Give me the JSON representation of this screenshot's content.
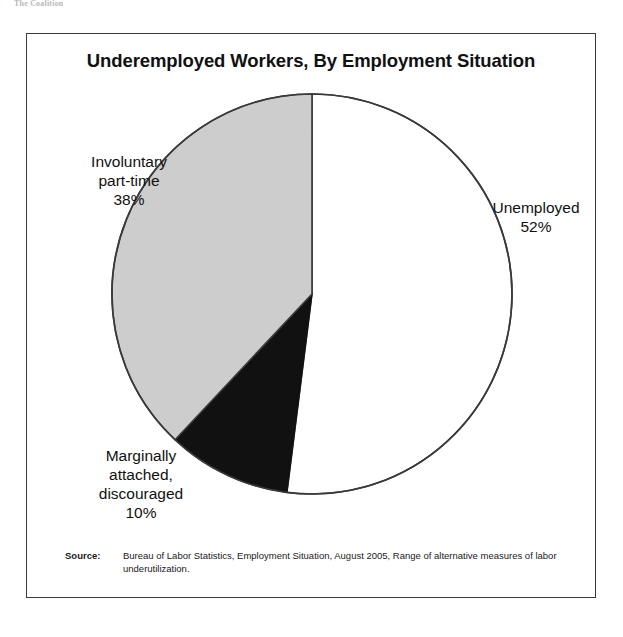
{
  "page": {
    "header_sliver": "The Coalition"
  },
  "figure": {
    "title": "Underemployed Workers, By Employment Situation",
    "source_label": "Source:",
    "source_text": "Bureau of Labor Statistics, Employment Situation, August 2005, Range of alternative measures of labor underutilization."
  },
  "chart_data": {
    "type": "pie",
    "title": "Underemployed Workers, By Employment Situation",
    "xlabel": "",
    "ylabel": "",
    "start_angle_deg": 0,
    "direction": "clockwise",
    "legend_position": "none",
    "labels_on_slices": false,
    "labels_outside": true,
    "categories": [
      "Unemployed",
      "Marginally attached, discouraged",
      "Involuntary part-time"
    ],
    "values": [
      52,
      10,
      38
    ],
    "unit": "percent",
    "slices": [
      {
        "name": "Unemployed",
        "label_line1": "Unemployed",
        "value": 52,
        "value_text": "52%",
        "color": "#ffffff",
        "stroke": "#3a3a3a",
        "start_deg": 0,
        "end_deg": 187.2
      },
      {
        "name": "Marginally attached, discouraged",
        "label_line1": "Marginally",
        "label_line2": "attached,",
        "label_line3": "discouraged",
        "value": 10,
        "value_text": "10%",
        "color": "#111111",
        "stroke": "#111111",
        "start_deg": 187.2,
        "end_deg": 223.2
      },
      {
        "name": "Involuntary part-time",
        "label_line1": "Involuntary",
        "label_line2": "part-time",
        "value": 38,
        "value_text": "38%",
        "color": "#cdcdcd",
        "stroke": "#3a3a3a",
        "start_deg": 223.2,
        "end_deg": 360
      }
    ]
  },
  "colors": {
    "frame": "#3a3a3a",
    "slice_unemployed": "#ffffff",
    "slice_marginally": "#111111",
    "slice_involuntary": "#cdcdcd",
    "text": "#111111"
  }
}
